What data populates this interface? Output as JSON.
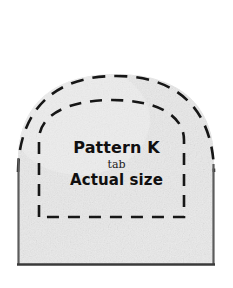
{
  "figure": {
    "kind": "sewing-pattern-template",
    "shape": "dome-arch-with-flat-bottom",
    "fill_color": "#e9e9e9",
    "fill_texture_color": "#dedede",
    "cut_line_color": "#1a1a1a",
    "cut_line_style": "dashed",
    "fold_line_color": "#1a1a1a",
    "fold_line_style": "dashed",
    "side_edge_color": "#555555",
    "bottom_edge_color": "#3a3a3a",
    "background_color": "#ffffff"
  },
  "labels": {
    "title": "Pattern K",
    "subtitle": "tab",
    "scale_note": "Actual size"
  }
}
